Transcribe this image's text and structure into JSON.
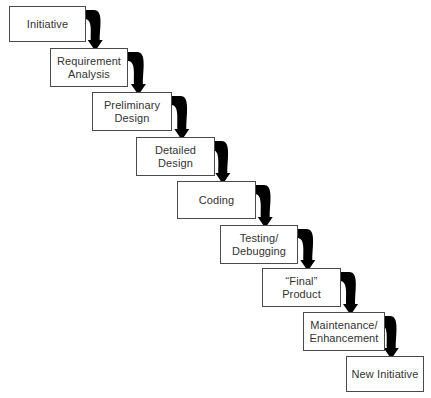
{
  "diagram": {
    "type": "flowchart-waterfall",
    "background_color": "#ffffff",
    "box_fill_color": "#ffffff",
    "box_border_color": "#4a4a4a",
    "text_color": "#333333",
    "arrow_color": "#000000",
    "stage_count": 9,
    "caption_remnant": "",
    "stages": [
      {
        "id": "initiative",
        "label": "Initiative",
        "x": 9,
        "y": 6,
        "w": 77,
        "h": 36
      },
      {
        "id": "requirement-analysis",
        "label": "Requirement\nAnalysis",
        "x": 50,
        "y": 48,
        "w": 78,
        "h": 39
      },
      {
        "id": "preliminary-design",
        "label": "Preliminary\nDesign",
        "x": 92,
        "y": 92,
        "w": 80,
        "h": 39
      },
      {
        "id": "detailed-design",
        "label": "Detailed\nDesign",
        "x": 136,
        "y": 137,
        "w": 79,
        "h": 39
      },
      {
        "id": "coding",
        "label": "Coding",
        "x": 177,
        "y": 181,
        "w": 79,
        "h": 38
      },
      {
        "id": "testing-debugging",
        "label": "Testing/\nDebugging",
        "x": 220,
        "y": 225,
        "w": 78,
        "h": 39
      },
      {
        "id": "final-product",
        "label": "“Final”\nProduct",
        "x": 262,
        "y": 268,
        "w": 79,
        "h": 39
      },
      {
        "id": "maintenance-enhancement",
        "label": "Maintenance/\nEnhancement",
        "x": 303,
        "y": 312,
        "w": 82,
        "h": 39
      },
      {
        "id": "new-initiative",
        "label": "New Initiative",
        "x": 346,
        "y": 356,
        "w": 78,
        "h": 36
      }
    ],
    "connectors": [
      {
        "id": "arrow-initiative-to-requirement-analysis",
        "from": "initiative",
        "to": "requirement-analysis"
      },
      {
        "id": "arrow-requirement-analysis-to-preliminary-design",
        "from": "requirement-analysis",
        "to": "preliminary-design"
      },
      {
        "id": "arrow-preliminary-design-to-detailed-design",
        "from": "preliminary-design",
        "to": "detailed-design"
      },
      {
        "id": "arrow-detailed-design-to-coding",
        "from": "detailed-design",
        "to": "coding"
      },
      {
        "id": "arrow-coding-to-testing-debugging",
        "from": "coding",
        "to": "testing-debugging"
      },
      {
        "id": "arrow-testing-debugging-to-final-product",
        "from": "testing-debugging",
        "to": "final-product"
      },
      {
        "id": "arrow-final-product-to-maintenance-enhancement",
        "from": "final-product",
        "to": "maintenance-enhancement"
      },
      {
        "id": "arrow-maintenance-enhancement-to-new-initiative",
        "from": "maintenance-enhancement",
        "to": "new-initiative"
      }
    ]
  }
}
